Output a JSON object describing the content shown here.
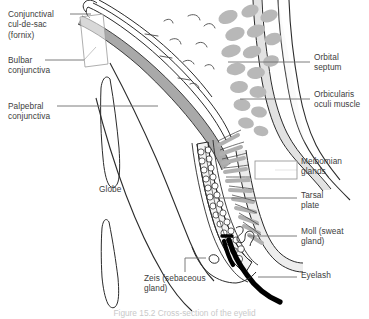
{
  "figure": {
    "title": "Cross-section of the eyelid",
    "caption": "Figure 15.2  Cross-section of the eyelid",
    "background_color": "#ffffff",
    "line_color": "#2b2b2b",
    "text_color": "#3d3d3d",
    "muscle_fill": "#b6b6b6",
    "septum_fill": "#d9d9d9",
    "conjunctiva_fill": "#a9a9a9",
    "lash_color": "#000000"
  },
  "labels": {
    "left": [
      {
        "id": "conjunctival-cul-de-sac",
        "text": "Conjunctival\ncul-de-sac\n(fornix)",
        "x": 8,
        "y": 9
      },
      {
        "id": "bulbar-conjunctiva",
        "text": "Bulbar\nconjunctiva",
        "x": 8,
        "y": 55
      },
      {
        "id": "palpebral-conjunctiva",
        "text": "Palpebral\nconjunctiva",
        "x": 8,
        "y": 101
      },
      {
        "id": "globe",
        "text": "Globe",
        "x": 99,
        "y": 184
      },
      {
        "id": "zeis-sebaceous-gland",
        "text": "Zeis (sebaceous\ngland)",
        "x": 144,
        "y": 273
      }
    ],
    "right": [
      {
        "id": "orbital-septum",
        "text": "Orbital\nseptum",
        "x": 314,
        "y": 52
      },
      {
        "id": "orbicularis-oculi-muscle",
        "text": "Orbicularis\noculi muscle",
        "x": 314,
        "y": 89
      },
      {
        "id": "meibomian-glands",
        "text": "Meibomian\nglands",
        "x": 301,
        "y": 156
      },
      {
        "id": "tarsal-plate",
        "text": "Tarsal\nplate",
        "x": 301,
        "y": 190
      },
      {
        "id": "moll-sweat-gland",
        "text": "Moll (sweat\ngland)",
        "x": 301,
        "y": 226
      },
      {
        "id": "eyelash",
        "text": "Eyelash",
        "x": 301,
        "y": 270
      }
    ]
  },
  "anatomy_parts": [
    "Conjunctival cul-de-sac (fornix)",
    "Bulbar conjunctiva",
    "Palpebral conjunctiva",
    "Globe",
    "Orbital septum",
    "Orbicularis oculi muscle",
    "Meibomian glands",
    "Tarsal plate",
    "Moll (sweat gland)",
    "Zeis (sebaceous gland)",
    "Eyelash"
  ]
}
